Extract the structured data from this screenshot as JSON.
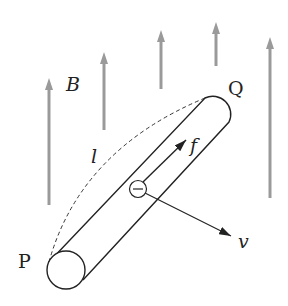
{
  "diagram": {
    "labels": {
      "field": "B",
      "end_p": "P",
      "end_q": "Q",
      "length": "l",
      "force": "f",
      "velocity": "v",
      "electron": "−"
    },
    "colors": {
      "field_arrows": "#9a9a9a",
      "lines": "#222222",
      "background": "#ffffff"
    },
    "field_arrows": [
      {
        "x": 49,
        "y_top": 78,
        "y_bottom": 205
      },
      {
        "x": 104,
        "y_top": 52,
        "y_bottom": 130
      },
      {
        "x": 161,
        "y_top": 30,
        "y_bottom": 89
      },
      {
        "x": 216,
        "y_top": 22,
        "y_bottom": 66
      },
      {
        "x": 270,
        "y_top": 37,
        "y_bottom": 198
      }
    ]
  }
}
